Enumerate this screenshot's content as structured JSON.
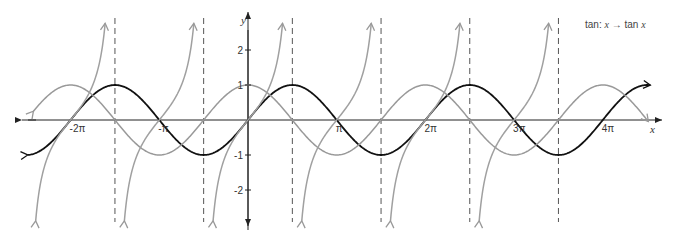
{
  "chart_data": {
    "type": "line",
    "title": "",
    "annotation": "tan: x → tan x",
    "xlabel": "x",
    "ylabel": "y",
    "xlim": [
      -7.8,
      14.3
    ],
    "ylim": [
      -2.9,
      2.9
    ],
    "grid": false,
    "x_ticks": [
      {
        "value": -6.2832,
        "label": "-2π"
      },
      {
        "value": -3.1416,
        "label": "-π"
      },
      {
        "value": 3.1416,
        "label": "π"
      },
      {
        "value": 6.2832,
        "label": "2π"
      },
      {
        "value": 9.4248,
        "label": "3π"
      },
      {
        "value": 12.5664,
        "label": "4π"
      }
    ],
    "y_ticks": [
      {
        "value": 2,
        "label": "2"
      },
      {
        "value": 1,
        "label": "1"
      },
      {
        "value": -1,
        "label": "-1"
      },
      {
        "value": -2,
        "label": "-2"
      }
    ],
    "asymptotes_x": [
      -4.7124,
      -1.5708,
      1.5708,
      4.7124,
      7.854,
      10.9956
    ],
    "series": [
      {
        "name": "sin x",
        "function": "sin",
        "color": "#111111",
        "x_range": [
          -7.8,
          14.25
        ]
      },
      {
        "name": "cos x",
        "function": "cos",
        "color": "#999999",
        "x_range": [
          -7.6,
          14.2
        ]
      },
      {
        "name": "tan x",
        "function": "tan",
        "color": "#a0a0a0",
        "x_range": [
          -7.25,
          10.95
        ]
      }
    ],
    "legend_position": "top-right"
  },
  "labels": {
    "y_axis": "y",
    "x_axis": "x",
    "annotation_prefix": "tan: ",
    "annotation_x1": "x",
    "annotation_arrow": " → tan ",
    "annotation_x2": "x"
  }
}
